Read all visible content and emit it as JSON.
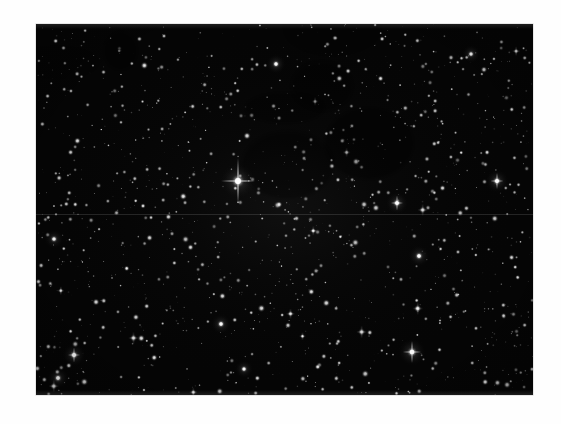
{
  "page": {
    "background_color": "#ffffff",
    "type": "astronomical-photograph",
    "caption": ""
  },
  "plate": {
    "name": "star-field-plate",
    "x": 36,
    "y": 24,
    "width": 497,
    "height": 371,
    "background_color": "#040404",
    "star_color": "#ffffff",
    "description": "Dense stellar field, monochrome astronomical exposure",
    "seam": {
      "present": true,
      "y_fraction": 0.512,
      "color": "#969696"
    }
  },
  "chart_data": {
    "type": "scatter",
    "title": "",
    "subtitle": "",
    "xlabel": "",
    "ylabel": "",
    "grid": false,
    "legend": null,
    "xlim": [
      0,
      497
    ],
    "ylim": [
      0,
      371
    ],
    "background": "#040404",
    "point_color": "#ffffff",
    "named_features": [
      {
        "label": "bright-star-with-diffraction-spikes",
        "x": 202,
        "y": 157,
        "radius": 7.0,
        "brightness": 1.0,
        "spikes": true,
        "spike_length_v": 46,
        "spike_length_h": 34
      },
      {
        "label": "bright-star-upper-right",
        "x": 461,
        "y": 157,
        "radius": 4.6,
        "brightness": 0.96,
        "spikes": true,
        "spike_length_v": 16,
        "spike_length_h": 13
      },
      {
        "label": "bright-star-mid-right",
        "x": 361,
        "y": 179,
        "radius": 4.4,
        "brightness": 0.95,
        "spikes": true,
        "spike_length_v": 15,
        "spike_length_h": 12
      },
      {
        "label": "bright-star-right-lower",
        "x": 383,
        "y": 232,
        "radius": 4.2,
        "brightness": 0.93,
        "spikes": false
      },
      {
        "label": "bright-star-lower-right",
        "x": 376,
        "y": 328,
        "radius": 5.4,
        "brightness": 0.99,
        "spikes": true,
        "spike_length_v": 22,
        "spike_length_h": 18
      },
      {
        "label": "bright-star-lower-left",
        "x": 38,
        "y": 331,
        "radius": 4.6,
        "brightness": 0.95,
        "spikes": true,
        "spike_length_v": 15,
        "spike_length_h": 12
      },
      {
        "label": "bright-star-bottom-left-corner",
        "x": 22,
        "y": 354,
        "radius": 4.2,
        "brightness": 0.94,
        "spikes": false
      },
      {
        "label": "bright-star-left-mid",
        "x": 18,
        "y": 215,
        "radius": 3.8,
        "brightness": 0.88,
        "spikes": false
      },
      {
        "label": "bright-star-bottom-center",
        "x": 185,
        "y": 300,
        "radius": 4.0,
        "brightness": 0.9,
        "spikes": false
      },
      {
        "label": "bright-star-top-center",
        "x": 240,
        "y": 40,
        "radius": 3.9,
        "brightness": 0.9,
        "spikes": false
      },
      {
        "label": "bright-star-top-right",
        "x": 435,
        "y": 30,
        "radius": 3.6,
        "brightness": 0.88,
        "spikes": false
      },
      {
        "label": "bright-star-center-lower",
        "x": 208,
        "y": 345,
        "radius": 3.6,
        "brightness": 0.86,
        "spikes": false
      }
    ],
    "field_stats": {
      "total_sources_rendered": 1500,
      "density": "very high",
      "dominant_magnitude_range": [
        1,
        6
      ]
    }
  }
}
